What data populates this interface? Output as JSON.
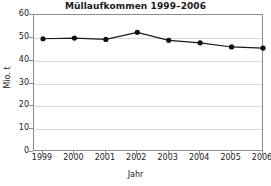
{
  "chart_data": {
    "type": "line",
    "title": "Müllaufkommen 1999–2006",
    "xlabel": "Jahr",
    "ylabel": "Mio. t",
    "categories": [
      "1999",
      "2000",
      "2001",
      "2002",
      "2003",
      "2004",
      "2005",
      "2006"
    ],
    "values": [
      49.6,
      49.9,
      49.3,
      52.4,
      48.9,
      47.8,
      46.0,
      45.5
    ],
    "series": [
      {
        "name": "Müllaufkommen",
        "values": [
          49.6,
          49.9,
          49.3,
          52.4,
          48.9,
          47.8,
          46.0,
          45.5
        ]
      }
    ],
    "ylim": [
      0,
      60
    ],
    "ytick_labels": [
      "0",
      "10",
      "20",
      "30",
      "40",
      "50",
      "60"
    ],
    "ytick_values": [
      0,
      10,
      20,
      30,
      40,
      50,
      60
    ],
    "grid": true,
    "legend": false,
    "legend_position": "none",
    "marker": "filled-circle",
    "line_color": "#1a1a1a",
    "marker_color": "#111111",
    "grid_color": "#d9d9d9",
    "frame_color": "#8c8c8c",
    "background_color": "#ffffff"
  }
}
